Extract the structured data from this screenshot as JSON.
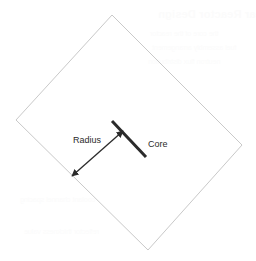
{
  "figure": {
    "name": "core-radius-diamond-diagram",
    "background_color": "#ffffff",
    "width": 256,
    "height": 261,
    "shape": {
      "name": "diamond-outline",
      "kind": "rotated-square",
      "stroke_color": "#c9c9c9",
      "stroke_width": 1,
      "fill": "none",
      "points": "112,15 242,145 148,250 16,120"
    },
    "core": {
      "label": "Core",
      "label_x": 148,
      "label_y": 147,
      "line_color": "#2b2b2b",
      "line_width": 3,
      "x1": 112,
      "y1": 121,
      "x2": 146,
      "y2": 157
    },
    "radius": {
      "label": "Radius",
      "label_x": 73,
      "label_y": 143,
      "line_color": "#2b2b2b",
      "line_width": 1.3,
      "x1": 123,
      "y1": 131,
      "x2": 72,
      "y2": 176,
      "arrowheads": "both"
    }
  },
  "background_showthrough": {
    "note": "faint mirrored bleed-through from reverse of scanned page",
    "color": "#fbfbfb",
    "title": "Nuclear Reactor Design",
    "lines": [
      "the core of the reactor",
      "fuel assembly arrangement",
      "neutron flux distribution",
      "coolant channel spacing",
      "reflector thickness value"
    ]
  }
}
